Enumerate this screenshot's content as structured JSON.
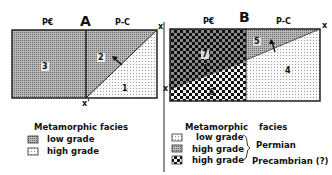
{
  "panel_a": {
    "title": "A",
    "col_left": "P€",
    "col_right": "P-C",
    "corner_top": "x",
    "corner_bottom": "x'",
    "regions": [
      {
        "id": "1",
        "facies": "high grade"
      },
      {
        "id": "2",
        "facies": "low grade"
      },
      {
        "id": "3",
        "facies": "low grade"
      }
    ],
    "legend": {
      "heading": "Metamorphic   facies",
      "items": [
        {
          "label": "low grade",
          "pattern": "grid"
        },
        {
          "label": "high grade",
          "pattern": "dots"
        }
      ]
    }
  },
  "panel_b": {
    "title": "B",
    "col_left": "P€",
    "col_right": "P-C",
    "corner_top": "x",
    "corner_left": "x'",
    "regions": [
      {
        "id": "4",
        "facies": "low grade"
      },
      {
        "id": "5",
        "facies": "high grade (Permian)"
      },
      {
        "id": "6",
        "facies": "high grade (Precambrian?) over low grade"
      },
      {
        "id": "7",
        "facies": "high grade (Precambrian?)"
      }
    ],
    "legend": {
      "heading_left": "Metamorphic",
      "heading_right": "facies",
      "items": [
        {
          "label": "low grade",
          "pattern": "dots"
        },
        {
          "label": "high grade",
          "pattern": "grid"
        },
        {
          "label": "high grade",
          "pattern": "checker"
        }
      ],
      "group_permian": "Permian",
      "group_precambrian": "Precambrian (?)"
    }
  },
  "colors": {
    "grid_fill": "#9a9a9a",
    "dots_fill": "#f4f4f4",
    "checker_dark": "#111111",
    "line": "#222222"
  }
}
